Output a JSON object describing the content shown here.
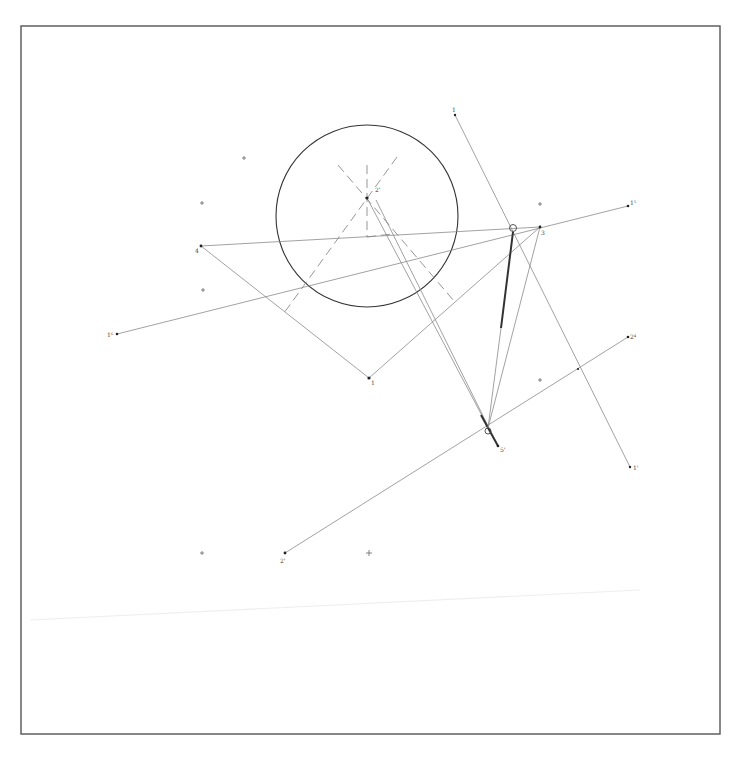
{
  "figure": {
    "type": "geometric construction drawing",
    "frame": {
      "x1": 21,
      "y1": 26,
      "x2": 720,
      "y2": 734,
      "color": "#555555"
    },
    "circle": {
      "cx": 367,
      "cy": 216,
      "r": 91
    },
    "points": [
      {
        "id": "p2",
        "label": "2'",
        "x": 367,
        "y": 198,
        "lx": 375,
        "ly": 192
      },
      {
        "id": "p4",
        "label": "4",
        "x": 201,
        "y": 246,
        "lx": 195,
        "ly": 252
      },
      {
        "id": "p3",
        "label": "3",
        "x": 540,
        "y": 227,
        "lx": 541,
        "ly": 235
      },
      {
        "id": "p1",
        "label": "1",
        "x": 369,
        "y": 378,
        "lx": 371,
        "ly": 384
      },
      {
        "id": "p15",
        "label": "1⁵",
        "x": 628,
        "y": 206,
        "lx": 630,
        "ly": 204
      },
      {
        "id": "p16",
        "label": "1⁶",
        "x": 117,
        "y": 334,
        "lx": 108,
        "ly": 336
      },
      {
        "id": "ptop",
        "label": "1",
        "x": 455,
        "y": 115,
        "lx": 453,
        "ly": 111
      },
      {
        "id": "pbr",
        "label": "1'",
        "x": 630,
        "y": 467,
        "lx": 633,
        "ly": 469
      },
      {
        "id": "p2p",
        "label": "2'",
        "x": 285,
        "y": 553,
        "lx": 280,
        "ly": 562
      },
      {
        "id": "p24",
        "label": "2⁴",
        "x": 628,
        "y": 337,
        "lx": 630,
        "ly": 337
      },
      {
        "id": "p5",
        "label": "5'",
        "x": 498,
        "y": 446,
        "lx": 500,
        "ly": 451
      }
    ],
    "crosses": [
      {
        "x": 244,
        "y": 158
      },
      {
        "x": 202,
        "y": 203
      },
      {
        "x": 203,
        "y": 290
      },
      {
        "x": 540,
        "y": 204
      },
      {
        "x": 540,
        "y": 380
      },
      {
        "x": 202,
        "y": 553
      },
      {
        "x": 369,
        "y": 553
      },
      {
        "x": 578,
        "y": 369
      }
    ],
    "cross_labels": [
      {
        "x": 199,
        "y": 206,
        "text": "3"
      },
      {
        "x": 537,
        "y": 207,
        "text": "4"
      }
    ],
    "small_circles": [
      {
        "cx": 513,
        "cy": 228,
        "r": 3.5
      },
      {
        "cx": 488,
        "cy": 431,
        "r": 3
      }
    ]
  }
}
